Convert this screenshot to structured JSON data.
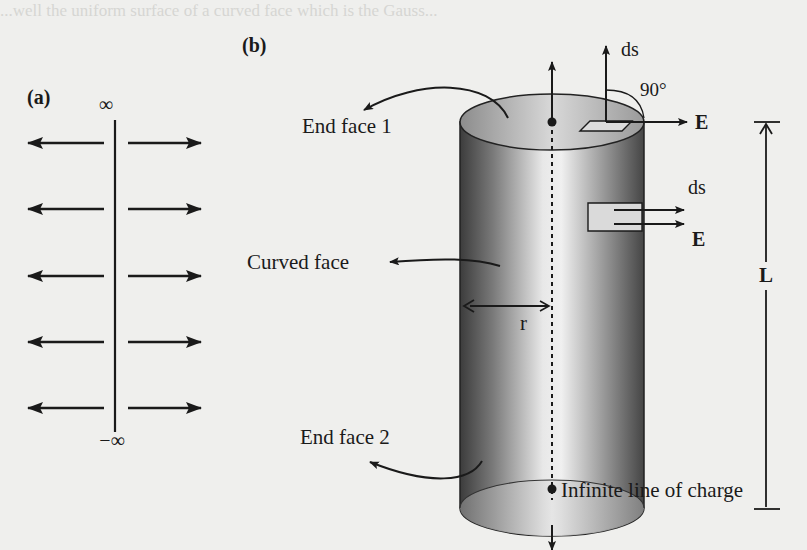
{
  "figure": {
    "panel_a": {
      "label": "(a)",
      "top_label": "∞",
      "bottom_label": "−∞",
      "arrow_rows": 5
    },
    "panel_b": {
      "label": "(b)",
      "labels": {
        "end_face_1": "End face 1",
        "end_face_2": "End face 2",
        "curved_face": "Curved face",
        "radius": "r",
        "length": "L",
        "line_of_charge": "Infinite line of charge",
        "ds_top": "ds",
        "e_top": "E",
        "angle": "90°",
        "ds_side": "ds",
        "e_side": "E"
      }
    },
    "colors": {
      "background": "#efefed",
      "ink": "#1a1a1a",
      "cylinder_dark": "#4a4a4a",
      "cylinder_light": "#f2f2f2"
    }
  },
  "background_bleed_text": {
    "line_1": "...well the uniform surface of a curved face which is the Gauss..."
  }
}
